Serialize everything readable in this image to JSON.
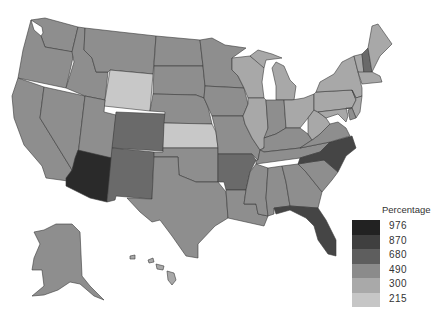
{
  "legend": {
    "title": "Percentage",
    "items": [
      {
        "label": "976",
        "color": "#222222"
      },
      {
        "label": "870",
        "color": "#3f3f3f"
      },
      {
        "label": "680",
        "color": "#5e5e5e"
      },
      {
        "label": "490",
        "color": "#8b8b8b"
      },
      {
        "label": "300",
        "color": "#a9a9a9"
      },
      {
        "label": "215",
        "color": "#c6c6c6"
      }
    ]
  },
  "colors": {
    "c976": "#2a2a2a",
    "c870": "#454545",
    "c680": "#6a6a6a",
    "c490": "#8e8e8e",
    "c300": "#a8a8a8",
    "c215": "#c8c8c8"
  },
  "states": {
    "WA": "c490",
    "OR": "c490",
    "CA": "c490",
    "ID": "c490",
    "NV": "c490",
    "MT": "c490",
    "WY": "c215",
    "UT": "c490",
    "AZ": "c976",
    "CO": "c680",
    "NM": "c680",
    "ND": "c490",
    "SD": "c490",
    "NE": "c490",
    "KS": "c215",
    "OK": "c490",
    "TX": "c490",
    "MN": "c490",
    "IA": "c490",
    "MO": "c490",
    "AR": "c680",
    "LA": "c490",
    "WI": "c300",
    "IL": "c300",
    "MI": "c300",
    "IN": "c490",
    "OH": "c300",
    "KY": "c490",
    "TN": "c490",
    "MS": "c490",
    "AL": "c490",
    "GA": "c490",
    "FL": "c870",
    "SC": "c490",
    "NC": "c870",
    "VA": "c490",
    "WV": "c300",
    "PA": "c300",
    "NY": "c300",
    "ME": "c300",
    "NH": "c680",
    "VT": "c300",
    "MA": "c300",
    "NJ": "c300",
    "MD": "c300",
    "DE": "c490",
    "AK": "c490",
    "HI": "c300"
  }
}
